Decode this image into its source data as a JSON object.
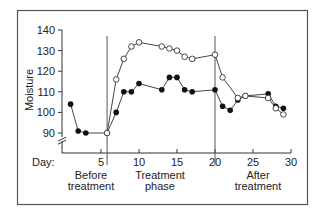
{
  "chart_data": {
    "type": "line",
    "title": "",
    "xlabel": "Day:",
    "ylabel": "Moisture",
    "xlim": [
      0,
      30
    ],
    "ylim": [
      85,
      140
    ],
    "y_axis_break": true,
    "grid": false,
    "x_ticks": [
      5,
      10,
      15,
      20,
      25,
      30
    ],
    "y_ticks": [
      90,
      100,
      110,
      120,
      130,
      140
    ],
    "phase_dividers": [
      5.8,
      20
    ],
    "phase_labels": [
      {
        "text": "Before\ntreatment",
        "x": 3
      },
      {
        "text": "Treatment\nphase",
        "x": 12.5
      },
      {
        "text": "After\ntreatment",
        "x": 25
      }
    ],
    "series": [
      {
        "name": "filled",
        "marker": "filled-circle",
        "points": [
          [
            1,
            104
          ],
          [
            2,
            91
          ],
          [
            3,
            90
          ],
          [
            5.8,
            90
          ],
          [
            7,
            100
          ],
          [
            8,
            110
          ],
          [
            9,
            110
          ],
          [
            10,
            114
          ],
          [
            13,
            111
          ],
          [
            14,
            117
          ],
          [
            15,
            117
          ],
          [
            16,
            111
          ],
          [
            17,
            110
          ],
          [
            20,
            111
          ],
          [
            21,
            103
          ],
          [
            22,
            101
          ],
          [
            23,
            106
          ],
          [
            24,
            108
          ],
          [
            27,
            109
          ],
          [
            28,
            103
          ],
          [
            29,
            102
          ]
        ]
      },
      {
        "name": "open",
        "marker": "open-circle",
        "points": [
          [
            5.8,
            90
          ],
          [
            7,
            116
          ],
          [
            8,
            126
          ],
          [
            9,
            132
          ],
          [
            10,
            134
          ],
          [
            13,
            132
          ],
          [
            14,
            131
          ],
          [
            15,
            130
          ],
          [
            16,
            127
          ],
          [
            17,
            126
          ],
          [
            20,
            128
          ],
          [
            21,
            117
          ],
          [
            23,
            107
          ],
          [
            24,
            108
          ],
          [
            27,
            107
          ],
          [
            28,
            102
          ],
          [
            29,
            99
          ]
        ]
      }
    ]
  },
  "labels": {
    "ylabel": "Moisture",
    "xlabel": "Day:",
    "phase1a": "Before",
    "phase1b": "treatment",
    "phase2a": "Treatment",
    "phase2b": "phase",
    "phase3a": "After",
    "phase3b": "treatment"
  }
}
